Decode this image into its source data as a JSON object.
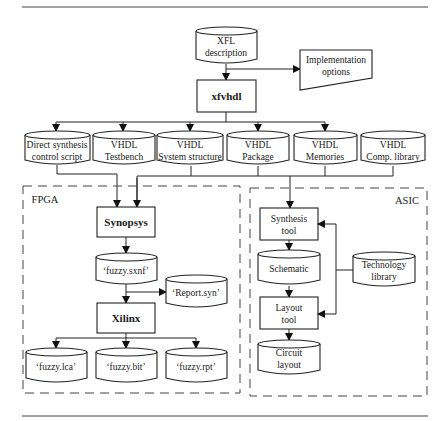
{
  "diagram": {
    "top_input": {
      "line1": "XFL",
      "line2": "description"
    },
    "options": {
      "line1": "Implementation",
      "line2": "options"
    },
    "tool": {
      "label": "xfvhdl"
    },
    "outputs": [
      {
        "line1": "Direct synthesis",
        "line2": "control script"
      },
      {
        "line1": "VHDL",
        "line2": "Testbench"
      },
      {
        "line1": "VHDL",
        "line2": "System structure"
      },
      {
        "line1": "VHDL",
        "line2": "Package"
      },
      {
        "line1": "VHDL",
        "line2": "Memories"
      },
      {
        "line1": "VHDL",
        "line2": "Comp. library"
      }
    ],
    "fpga": {
      "title": "FPGA",
      "synopsys": "Synopsys",
      "sxnf": "‘fuzzy.sxnf’",
      "report": "‘Report.syn’",
      "xilinx": "Xilinx",
      "files": [
        "‘fuzzy.lca’",
        "‘fuzzy.bit’",
        "‘fuzzy.rpt’"
      ]
    },
    "asic": {
      "title": "ASIC",
      "synthesis": {
        "line1": "Synthesis",
        "line2": "tool"
      },
      "schematic": "Schematic",
      "layout_tool": {
        "line1": "Layout",
        "line2": "tool"
      },
      "circuit": {
        "line1": "Circuit",
        "line2": "layout"
      },
      "tech_lib": {
        "line1": "Technology",
        "line2": "library"
      }
    }
  }
}
